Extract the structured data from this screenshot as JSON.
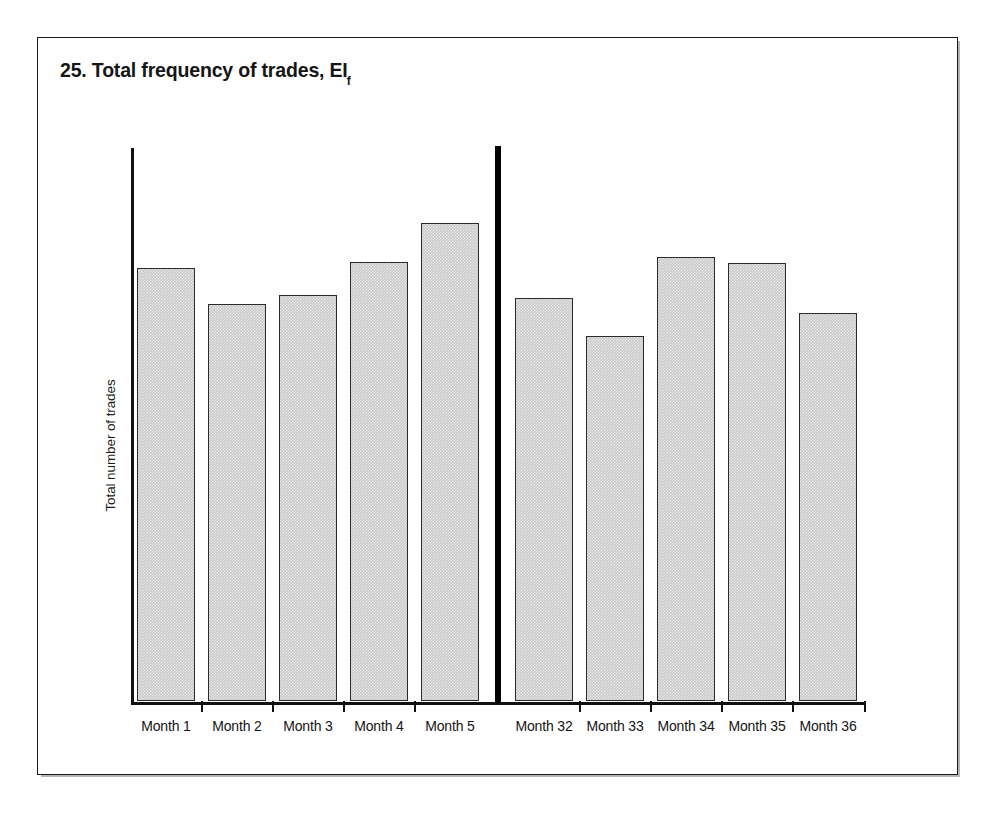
{
  "figure": {
    "number": "25.",
    "title_text": "25. Total frequency of trades, EI",
    "title_subscript": "f",
    "y_axis_label": "Total number of trades"
  },
  "chart_data": {
    "type": "bar",
    "title": "25. Total frequency of trades, EIf",
    "xlabel": "",
    "ylabel": "Total number of trades",
    "grid": false,
    "legend": null,
    "axis_tick_labels_y": [],
    "group_separator_after_index": 4,
    "categories": [
      "Month 1",
      "Month 2",
      "Month 3",
      "Month 4",
      "Month 5",
      "Month 32",
      "Month 33",
      "Month 34",
      "Month 35",
      "Month 36"
    ],
    "values": [
      80,
      72,
      74,
      81,
      89,
      75,
      67,
      83,
      82,
      72
    ],
    "bar_top_px": [
      267,
      303,
      294,
      261,
      222,
      297,
      335,
      256,
      262,
      312
    ],
    "baseline_px": 700,
    "groups": [
      {
        "name": "early",
        "categories": [
          "Month 1",
          "Month 2",
          "Month 3",
          "Month 4",
          "Month 5"
        ]
      },
      {
        "name": "late",
        "categories": [
          "Month 32",
          "Month 33",
          "Month 34",
          "Month 35",
          "Month 36"
        ]
      }
    ]
  },
  "style": {
    "bar_fill": "#c9c9c9",
    "bar_stroke": "#2b2b2b",
    "axis_color": "#111111",
    "frame_color": "#1a1a1a",
    "text_color": "#141414",
    "background": "#ffffff"
  }
}
